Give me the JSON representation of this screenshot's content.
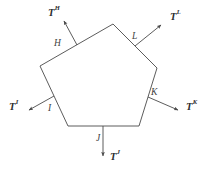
{
  "figure": {
    "type": "traction-vector-pentagon-diagram",
    "background_color": "#ffffff",
    "stroke_color": "#4a4a4a",
    "text_color": "#3b3b3b"
  },
  "polygon": {
    "name": "pentagon",
    "vertices": [
      {
        "id": "top",
        "x": 113,
        "y": 24
      },
      {
        "id": "right",
        "x": 157,
        "y": 68
      },
      {
        "id": "bottom-right",
        "x": 139,
        "y": 126
      },
      {
        "id": "bottom-left",
        "x": 68,
        "y": 126
      },
      {
        "id": "upper-left",
        "x": 40,
        "y": 66
      }
    ]
  },
  "edges": [
    {
      "id": "H",
      "label": "H",
      "label_x": 54,
      "label_y": 39
    },
    {
      "id": "I",
      "label": "I",
      "label_x": 48,
      "label_y": 104
    },
    {
      "id": "J",
      "label": "J",
      "label_x": 96,
      "label_y": 134
    },
    {
      "id": "K",
      "label": "K",
      "label_x": 151,
      "label_y": 88
    },
    {
      "id": "L",
      "label": "L",
      "label_x": 132,
      "label_y": 32
    }
  ],
  "vectors": [
    {
      "id": "T-H",
      "symbol": "T",
      "superscript": "H",
      "direction": "up-left",
      "label_x": 48,
      "label_y": 6,
      "start": {
        "x": 77,
        "y": 45
      },
      "end": {
        "x": 64,
        "y": 21
      }
    },
    {
      "id": "T-I",
      "symbol": "T",
      "superscript": "I",
      "direction": "left",
      "label_x": 9,
      "label_y": 100,
      "start": {
        "x": 54,
        "y": 96
      },
      "end": {
        "x": 29,
        "y": 110
      }
    },
    {
      "id": "T-J",
      "symbol": "T",
      "superscript": "J",
      "direction": "down",
      "label_x": 110,
      "label_y": 150,
      "start": {
        "x": 103,
        "y": 126
      },
      "end": {
        "x": 103,
        "y": 156
      }
    },
    {
      "id": "T-K",
      "symbol": "T",
      "superscript": "K",
      "direction": "right",
      "label_x": 186,
      "label_y": 100,
      "start": {
        "x": 148,
        "y": 97
      },
      "end": {
        "x": 178,
        "y": 110
      }
    },
    {
      "id": "T-L",
      "symbol": "T",
      "superscript": "L",
      "direction": "up-right",
      "label_x": 170,
      "label_y": 10,
      "start": {
        "x": 135,
        "y": 46
      },
      "end": {
        "x": 161,
        "y": 25
      }
    }
  ],
  "chart_data": {
    "type": "diagram",
    "title": "",
    "faces": [
      "H",
      "I",
      "J",
      "K",
      "L"
    ],
    "traction_labels": [
      "T^H",
      "T^I",
      "T^J",
      "T^K",
      "T^L"
    ]
  }
}
